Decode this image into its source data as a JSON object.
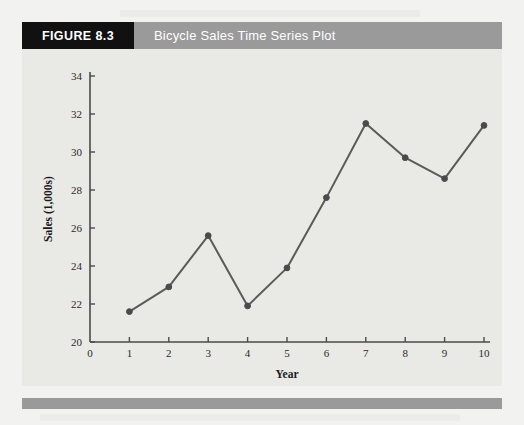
{
  "figure": {
    "tag": "FIGURE 8.3",
    "title": "Bicycle Sales Time Series Plot"
  },
  "chart_data": {
    "type": "line",
    "title": "Bicycle Sales Time Series Plot",
    "xlabel": "Year",
    "ylabel": "Sales (1,000s)",
    "x": [
      1,
      2,
      3,
      4,
      5,
      6,
      7,
      8,
      9,
      10
    ],
    "values": [
      21.6,
      22.9,
      25.6,
      21.9,
      23.9,
      27.6,
      31.5,
      29.7,
      28.6,
      31.4
    ],
    "xlim": [
      0,
      10
    ],
    "ylim": [
      20,
      34
    ],
    "xticks": [
      0,
      1,
      2,
      3,
      4,
      5,
      6,
      7,
      8,
      9,
      10
    ],
    "yticks": [
      20,
      22,
      24,
      26,
      28,
      30,
      32,
      34
    ],
    "grid": false,
    "legend": "none",
    "marker": "filled-circle",
    "line_color": "#5a5a5a",
    "marker_color": "#4a4a4a"
  },
  "colors": {
    "tag_bg": "#111111",
    "bar_bg": "#9a9a9a",
    "panel_bg": "#e9e9e6",
    "page_bg": "#f2f2f0",
    "axis": "#4a4a4a"
  }
}
